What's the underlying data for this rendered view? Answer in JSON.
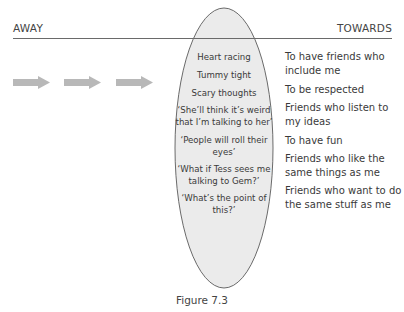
{
  "header": {
    "left_label": "AWAY",
    "right_label": "TOWARDS"
  },
  "arrows": {
    "count": 3,
    "direction": "right",
    "color": "#b8b8b8"
  },
  "ellipse": {
    "fill": "#ebebeb",
    "stroke": "#5a5a5a",
    "items": [
      "Heart racing",
      "Tummy tight",
      "Scary thoughts",
      "‘She’ll think it’s weird that I’m talking to her’",
      "‘People will roll their eyes’",
      "‘What if Tess sees me talking to Gem?’",
      "‘What’s the point of this?’"
    ]
  },
  "towards_items": [
    "To have friends who include me",
    "To be respected",
    "Friends who listen to my ideas",
    "To have fun",
    "Friends who like the same things as me",
    "Friends who want to do the same stuff as me"
  ],
  "caption": "Figure 7.3"
}
